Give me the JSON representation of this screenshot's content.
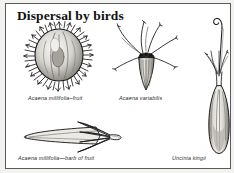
{
  "plate": {
    "title": "Dispersal by birds",
    "background_color": "#ffffff",
    "border_color": "#5b5b5b",
    "ink_color": "#1c1c1c"
  },
  "figures": [
    {
      "id": "acaena-millifolia-fruit",
      "caption": "Acaena millifolia–fruit",
      "icon": "spiny-burr-fruit-illustration",
      "position": "top-left"
    },
    {
      "id": "acaena-variabilis",
      "caption": "Acaena variabilis",
      "icon": "awned-seed-illustration",
      "position": "top-center"
    },
    {
      "id": "acaena-millifolia-barb",
      "caption": "Acaena millifolia—barb of fruit",
      "icon": "barbed-spine-illustration",
      "position": "bottom-left"
    },
    {
      "id": "uncinia-kingii",
      "caption": "Uncinia kingii",
      "icon": "hooked-utricle-illustration",
      "position": "right"
    }
  ]
}
